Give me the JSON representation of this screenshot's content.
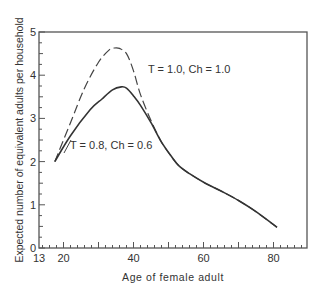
{
  "chart_data": {
    "type": "line",
    "title": "",
    "xlabel": "Age of female adult",
    "ylabel": "Expected number of equivalent adults per household",
    "xlim": [
      13,
      90
    ],
    "ylim": [
      0,
      5
    ],
    "x_ticks": [
      13,
      20,
      40,
      60,
      80
    ],
    "y_ticks": [
      0,
      1,
      2,
      3,
      4,
      5
    ],
    "grid": false,
    "legend": "inline annotations",
    "series": [
      {
        "name": "T = 1.0, Ch = 1.0",
        "style": "dashed",
        "x": [
          17.5,
          22,
          26,
          30,
          33,
          34.5,
          36,
          38,
          40,
          42,
          45,
          48,
          51,
          53,
          56,
          60.5,
          65,
          70,
          75,
          81
        ],
        "y": [
          2.0,
          2.9,
          3.7,
          4.3,
          4.58,
          4.63,
          4.62,
          4.5,
          4.1,
          3.55,
          2.95,
          2.45,
          2.1,
          1.9,
          1.72,
          1.5,
          1.32,
          1.1,
          0.84,
          0.48
        ]
      },
      {
        "name": "T = 0.8, Ch = 0.6",
        "style": "solid",
        "x": [
          17.5,
          22,
          27.6,
          31,
          34,
          36.5,
          38,
          40,
          42,
          45,
          48,
          51,
          53,
          56,
          60.5,
          65,
          70,
          75,
          81
        ],
        "y": [
          2.0,
          2.6,
          3.2,
          3.45,
          3.66,
          3.73,
          3.7,
          3.52,
          3.3,
          2.9,
          2.45,
          2.1,
          1.9,
          1.72,
          1.5,
          1.32,
          1.1,
          0.84,
          0.48
        ]
      }
    ],
    "annotations": [
      {
        "text": "T = 1.0,  Ch = 1.0",
        "x": 45,
        "y": 4.4
      },
      {
        "text": "T = 0.8,  Ch = 0.6",
        "x": 19.5,
        "y": 2.2
      }
    ]
  }
}
